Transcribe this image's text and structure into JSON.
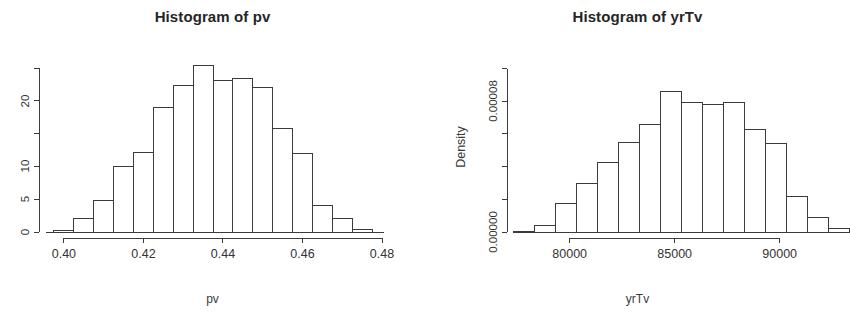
{
  "figure": {
    "background": "#ffffff",
    "foreground": "#333333",
    "panel_count": 2
  },
  "chart_data": [
    {
      "type": "bar",
      "subtype": "histogram",
      "panel": "left",
      "title": "Histogram of pv",
      "xlabel": "pv",
      "ylabel": "",
      "grid": false,
      "legend": "none",
      "xlim": [
        0.3955,
        0.4805
      ],
      "ylim": [
        0,
        25.8
      ],
      "xticks": [
        0.4,
        0.42,
        0.44,
        0.46,
        0.48
      ],
      "xtick_labels": [
        "0.40",
        "0.42",
        "0.44",
        "0.46",
        "0.48"
      ],
      "yticks": [
        0,
        5,
        10,
        15,
        20,
        25
      ],
      "ytick_labels": [
        "0",
        "5",
        "10",
        "",
        "20",
        ""
      ],
      "bin_width": 0.005,
      "bin_edges": [
        0.3975,
        0.4025,
        0.4075,
        0.4125,
        0.4175,
        0.4225,
        0.4275,
        0.4325,
        0.4375,
        0.4425,
        0.4475,
        0.4525,
        0.4575,
        0.4625,
        0.4675,
        0.4725,
        0.4775
      ],
      "categories": [
        "0.3975-0.4025",
        "0.4025-0.4075",
        "0.4075-0.4125",
        "0.4125-0.4175",
        "0.4175-0.4225",
        "0.4225-0.4275",
        "0.4275-0.4325",
        "0.4325-0.4375",
        "0.4375-0.4425",
        "0.4425-0.4475",
        "0.4475-0.4525",
        "0.4525-0.4575",
        "0.4575-0.4625",
        "0.4625-0.4675",
        "0.4675-0.4725",
        "0.4725-0.4775"
      ],
      "values": [
        0.3,
        2.1,
        4.8,
        10.0,
        12.2,
        19.0,
        22.4,
        25.4,
        23.2,
        23.4,
        22.0,
        15.8,
        12.0,
        4.1,
        2.0,
        0.4
      ]
    },
    {
      "type": "bar",
      "subtype": "histogram",
      "panel": "right",
      "title": "Histogram of yrTv",
      "xlabel": "yrTv",
      "ylabel": "Density",
      "grid": false,
      "legend": "none",
      "xlim": [
        77300,
        93300
      ],
      "ylim": [
        0,
        0.000104
      ],
      "xticks": [
        80000,
        85000,
        90000
      ],
      "xtick_labels": [
        "80000",
        "85000",
        "90000"
      ],
      "yticks": [
        0.0,
        2e-05,
        4e-05,
        6e-05,
        8e-05,
        0.0001
      ],
      "ytick_labels": [
        "0.00000",
        "",
        "",
        "",
        "0.00008",
        ""
      ],
      "bin_width": 1000,
      "bin_edges": [
        77300,
        78300,
        79300,
        80300,
        81300,
        82300,
        83300,
        84300,
        85300,
        86300,
        87300,
        88300,
        89300,
        90300,
        91300,
        92300,
        93300
      ],
      "categories": [
        "77300-78300",
        "78300-79300",
        "79300-80300",
        "80300-81300",
        "81300-82300",
        "82300-83300",
        "83300-84300",
        "84300-85300",
        "85300-86300",
        "86300-87300",
        "87300-88300",
        "88300-89300",
        "89300-90300",
        "90300-91300",
        "91300-92300",
        "92300-93300"
      ],
      "values": [
        4e-07,
        4e-06,
        1.75e-05,
        2.95e-05,
        4.25e-05,
        5.45e-05,
        6.55e-05,
        8.6e-05,
        7.95e-05,
        7.8e-05,
        7.9e-05,
        6.25e-05,
        5.4e-05,
        2.2e-05,
        9e-06,
        2.2e-06
      ]
    }
  ]
}
